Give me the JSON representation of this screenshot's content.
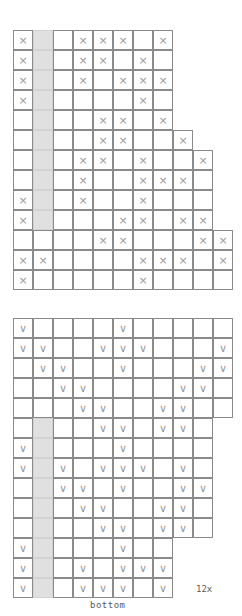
{
  "page": {
    "kind": "knitting-stitch-chart-pair",
    "background_color": "#ffffff",
    "grid_line_color": "#8a8a8a",
    "shaded_column_color": "#e0e0e0",
    "symbol_color": "#9a9a9a"
  },
  "labels": {
    "repeat": "12x",
    "bottom": "bottom"
  },
  "charts": [
    {
      "id": "chart-top",
      "symbol": "×",
      "symbol_name": "cross-stitch-symbol",
      "columns": 11,
      "rows": 13,
      "shaded_column_index": 1,
      "shaded_column_rows": [
        0,
        1,
        2,
        3,
        4,
        5,
        6,
        7,
        8,
        9
      ],
      "row_widths": [
        8,
        8,
        8,
        8,
        8,
        9,
        10,
        10,
        10,
        10,
        11,
        11,
        11
      ],
      "row_starts": [
        0,
        0,
        0,
        0,
        0,
        0,
        0,
        0,
        0,
        0,
        0,
        0,
        0
      ],
      "filled": [
        [
          0,
          3,
          4,
          5,
          7,
          8,
          9
        ],
        [
          0,
          3,
          4,
          6,
          8,
          9
        ],
        [
          0,
          3,
          5,
          6,
          7,
          9
        ],
        [
          0,
          6
        ],
        [
          4,
          5,
          7,
          8
        ],
        [
          4,
          5,
          8,
          9
        ],
        [
          3,
          4,
          6,
          9,
          10
        ],
        [
          3,
          6,
          7,
          8,
          10
        ],
        [
          0,
          3,
          6
        ],
        [
          0,
          5,
          6,
          8,
          9
        ],
        [
          4,
          5,
          9,
          10
        ],
        [
          0,
          1,
          6,
          7,
          8,
          10
        ],
        [
          0,
          6
        ]
      ]
    },
    {
      "id": "chart-bottom",
      "symbol": "∨",
      "symbol_name": "chevron-stitch-symbol",
      "columns": 11,
      "rows": 14,
      "shaded_column_index": 1,
      "shaded_column_rows": [
        5,
        6,
        7,
        8,
        9,
        10,
        11,
        12,
        13
      ],
      "row_widths": [
        11,
        11,
        11,
        11,
        11,
        10,
        10,
        10,
        10,
        10,
        10,
        8,
        8,
        8
      ],
      "row_starts": [
        0,
        0,
        0,
        0,
        0,
        0,
        0,
        0,
        0,
        0,
        0,
        0,
        0,
        0
      ],
      "filled": [
        [
          0,
          5
        ],
        [
          0,
          1,
          4,
          5,
          6,
          10
        ],
        [
          1,
          2,
          5,
          9,
          10
        ],
        [
          2,
          3,
          8,
          9
        ],
        [
          3,
          4,
          7,
          8
        ],
        [
          4,
          5,
          7,
          8
        ],
        [
          0,
          5
        ],
        [
          0,
          2,
          4,
          5,
          6,
          8
        ],
        [
          2,
          3,
          5,
          8,
          9
        ],
        [
          3,
          4,
          7,
          8
        ],
        [
          4,
          5,
          7,
          8
        ],
        [
          0,
          5
        ],
        [
          0,
          3,
          5,
          6,
          7
        ],
        [
          0,
          3,
          4,
          5,
          7,
          8,
          9
        ]
      ]
    }
  ]
}
